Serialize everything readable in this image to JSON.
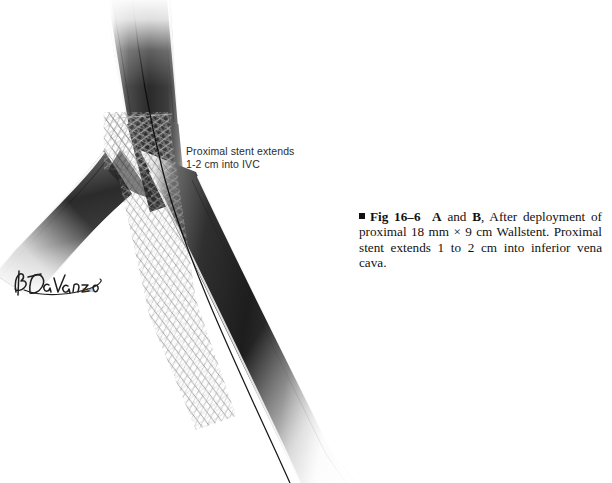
{
  "figure": {
    "annotation": "Proximal stent extends\n1-2 cm into IVC",
    "annotation_line1": "Proximal stent extends",
    "annotation_line2": "1-2 cm into IVC",
    "signature": "B DaVanzo",
    "signature_suffix": "CMI",
    "colors": {
      "background": "#ffffff",
      "vessel_dark": "#1a1a1a",
      "vessel_mid": "#5a5a5a",
      "vessel_highlight": "#ffffff",
      "stent_mesh": "#2e2e2e",
      "guidewire": "#0d0d0d",
      "text": "#2b2b2b",
      "caption_text": "#111111"
    }
  },
  "caption": {
    "bullet": "square-marker",
    "fig_number": "Fig 16–6",
    "panel_a": "A",
    "conjunction": " and ",
    "panel_b": "B",
    "text_1": ", After deployment of proximal 18 mm ",
    "times": "×",
    "text_2": " 9 cm Wallstent. Proximal stent extends 1 to 2 cm into inferior vena cava.",
    "full_text": "Fig 16–6 A and B, After deployment of proximal 18 mm × 9 cm Wallstent. Proximal stent extends 1 to 2 cm into inferior vena cava."
  },
  "anatomy": {
    "vessels": [
      {
        "name": "inferior vena cava",
        "abbr": "IVC",
        "stented": true
      },
      {
        "name": "right common iliac vein",
        "stented": true
      },
      {
        "name": "left common iliac vein",
        "stented": false
      }
    ],
    "device": {
      "name": "Wallstent",
      "diameter": "18 mm",
      "length": "9 cm",
      "mesh": "braided-diamond"
    },
    "guidewire": true
  }
}
